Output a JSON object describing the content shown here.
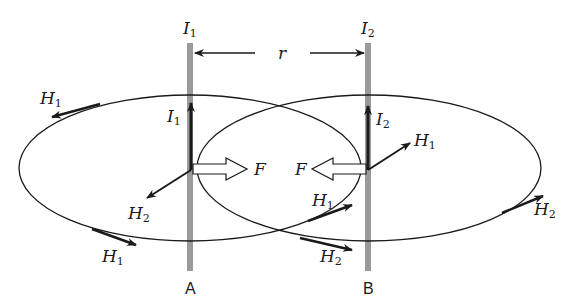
{
  "diagram": {
    "conductors": [
      {
        "name": "A",
        "current_label": "I",
        "current_sub": "1"
      },
      {
        "name": "B",
        "current_label": "I",
        "current_sub": "2"
      }
    ],
    "distance_label": "r",
    "force_label": "F",
    "field_labels": {
      "H1": {
        "main": "H",
        "sub": "1"
      },
      "H2": {
        "main": "H",
        "sub": "2"
      }
    },
    "colors": {
      "conductor": "#9a9a9a",
      "line": "#1a1a1a",
      "background": "#ffffff"
    }
  }
}
